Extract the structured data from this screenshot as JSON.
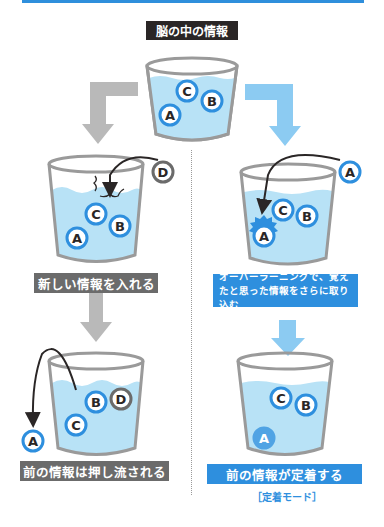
{
  "title": "脳の中の情報",
  "left_path": {
    "step1_label": "新しい情報を入れる",
    "step2_label": "前の情報は押し流される",
    "cup1_balls": [
      "A",
      "C",
      "B"
    ],
    "incoming_ball": "D",
    "cup2_balls": [
      "B",
      "D",
      "C"
    ],
    "ejected_ball": "A"
  },
  "right_path": {
    "step1_label": "オーバーラーニングで、覚えたと思った情報をさらに取り込む",
    "step2_label": "前の情報が定着する",
    "mode_label": "［定着モード］",
    "cup1_balls": [
      "C",
      "B",
      "A"
    ],
    "incoming_ball": "A",
    "cup2_balls": [
      "C",
      "B",
      "A"
    ]
  },
  "top_cup_balls": [
    "C",
    "B",
    "A"
  ],
  "colors": {
    "accent_blue": "#2e8fde",
    "water": "#b8e2f6",
    "cup_gray": "#9a9a9a",
    "arrow_gray": "#b9b9b9",
    "arrow_blue": "#8ccbf2",
    "label_dark": "#2a2626",
    "label_gray": "#6b6b6b"
  }
}
